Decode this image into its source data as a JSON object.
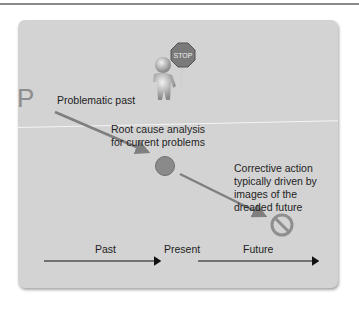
{
  "diagram": {
    "letter": "P",
    "labels": {
      "problematic_past": "Problematic past",
      "root_cause_line1": "Root cause analysis",
      "root_cause_line2": "for current problems",
      "corrective_line1": "Corrective action",
      "corrective_line2": "typically driven by",
      "corrective_line3": "images of the",
      "corrective_line4": "dreaded future"
    },
    "sign_text": "STOP",
    "timeline": {
      "past": "Past",
      "present": "Present",
      "future": "Future"
    },
    "colors": {
      "card": "#d3d3d3",
      "arrow_gray": "#7f7f7f",
      "circle": "#8a8a8a",
      "no_symbol": "#8f8f8f",
      "text": "#1e1e1e"
    }
  }
}
